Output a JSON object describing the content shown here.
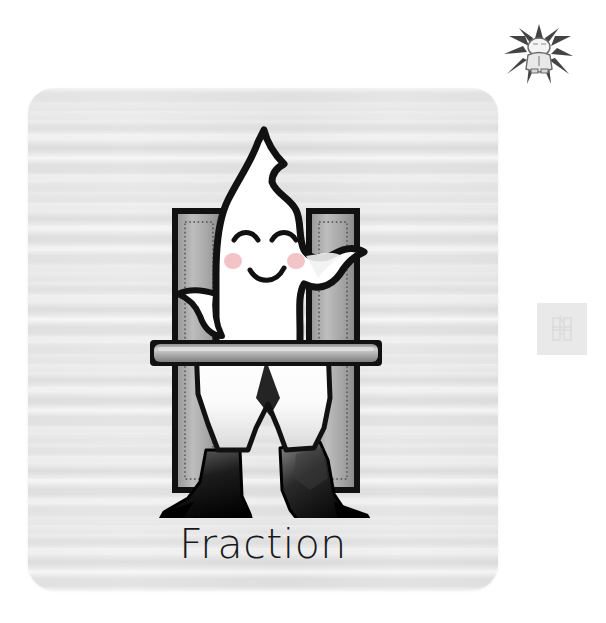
{
  "card": {
    "caption": "Fraction",
    "background_color": "#e6e6e6",
    "corner_radius_px": 26
  },
  "illustration": {
    "subject": "white flame ghost character standing inside letter H frame",
    "character_name": "flame-character",
    "character_color": "#ffffff",
    "outline_color": "#111111",
    "blush_color": "#f0b9bd",
    "boot_color": "#111111",
    "letter": {
      "glyph": "H",
      "bar_fill_light": "#b3b3b3",
      "bar_fill_dark": "#8f8f8f",
      "bar_outline": "#111111",
      "dotted_inset_color": "#5a5a5a"
    }
  },
  "badges": {
    "mascot_badge_name": "starburst-mascot-icon",
    "side_tab_name": "character-tab-icon",
    "side_tab_color": "#e9e9e9"
  }
}
